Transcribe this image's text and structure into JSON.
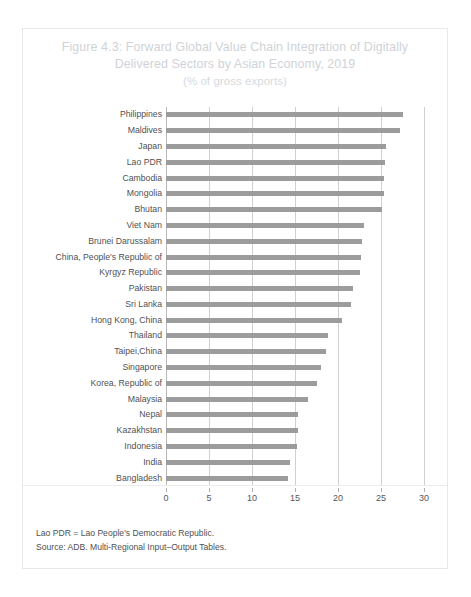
{
  "figure": {
    "title_line1": "Figure 4.3: Forward Global Value Chain Integration of Digitally",
    "title_line2": "Delivered Sectors by Asian Economy, 2019",
    "title_line3": "(% of gross exports)",
    "footnote_abbreviation": "Lao PDR = Lao People's Democratic Republic.",
    "footnote_source": "Source: ADB. Multi-Regional Input–Output Tables."
  },
  "style": {
    "bar_color": "#9c9c9c",
    "gridline_color": "#d0d0d0",
    "title_color": "#cfd3d8",
    "label_color": "#4f5153",
    "frame_color": "#e8e8e8"
  },
  "chart_data": {
    "type": "bar",
    "orientation": "horizontal",
    "title": "Figure 4.3: Forward Global Value Chain Integration of Digitally Delivered Sectors by Asian Economy, 2019",
    "subtitle": "(% of gross exports)",
    "xlabel": "",
    "ylabel": "",
    "xlim": [
      0,
      30
    ],
    "xticks": [
      0,
      5,
      10,
      15,
      20,
      25,
      30
    ],
    "xtick_labels": [
      "0",
      "5",
      "10",
      "15",
      "20",
      "25",
      "30"
    ],
    "grid": true,
    "grid_axis": "x",
    "legend": false,
    "categories": [
      "Philippines",
      "Maldives",
      "Japan",
      "Lao PDR",
      "Cambodia",
      "Mongolia",
      "Bhutan",
      "Viet Nam",
      "Brunei Darussalam",
      "China, People's Republic of",
      "Kyrgyz Republic",
      "Pakistan",
      "Sri Lanka",
      "Hong Kong, China",
      "Thailand",
      "Taipei,China",
      "Singapore",
      "Korea, Republic of",
      "Malaysia",
      "Nepal",
      "Kazakhstan",
      "Indonesia",
      "India",
      "Bangladesh"
    ],
    "values": [
      27.6,
      27.2,
      25.6,
      25.5,
      25.4,
      25.3,
      25.1,
      23.0,
      22.8,
      22.7,
      22.6,
      21.8,
      21.5,
      20.5,
      18.8,
      18.6,
      18.0,
      17.6,
      16.5,
      15.3,
      15.3,
      15.2,
      14.4,
      14.2
    ]
  }
}
